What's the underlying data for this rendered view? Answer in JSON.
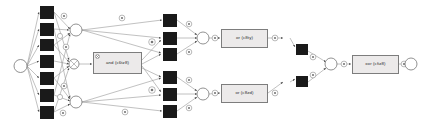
{
  "diagram": {
    "type": "process-model-graph",
    "title": "",
    "background_color": "#ffffff",
    "colors": {
      "transition_fill": "#1a1a1a",
      "place_fill": "#ffffff",
      "place_stroke": "#6e6e6e",
      "edge_stroke": "#9a9a9a",
      "box_fill": "#eceaea",
      "box_stroke": "#7d7d7d",
      "marker_stroke": "#8a8a8a",
      "text_color": "#2b2b2b"
    },
    "labels": {
      "and_box": "and (c6tz8)",
      "or_box_top": "or (c8ty)",
      "or_box_bottom": "or (c8zd)",
      "xor_box": "xor (cfiz8)"
    },
    "counts": {
      "source_places": 1,
      "sink_places": 1,
      "transitions_column1": 7,
      "transitions_column2": 6,
      "transitions_column3": 2,
      "join_places": 4,
      "labeled_boxes": 4
    },
    "nodes": {
      "source": {
        "name": "source-place",
        "cx": 20.5,
        "cy": 66,
        "r": 6.5
      },
      "sink": {
        "name": "sink-place",
        "cx": 411,
        "cy": 64,
        "r": 6
      },
      "col1": [
        {
          "x": 40,
          "y": 6,
          "w": 14,
          "h": 13
        },
        {
          "x": 40,
          "y": 23,
          "w": 14,
          "h": 13
        },
        {
          "x": 40,
          "y": 39,
          "w": 14,
          "h": 12
        },
        {
          "x": 40,
          "y": 55,
          "w": 14,
          "h": 13
        },
        {
          "x": 40,
          "y": 72,
          "w": 14,
          "h": 13
        },
        {
          "x": 40,
          "y": 89,
          "w": 14,
          "h": 13
        },
        {
          "x": 40,
          "y": 106,
          "w": 14,
          "h": 13
        }
      ],
      "col1_places": [
        {
          "cx": 76,
          "cy": 30,
          "r": 6
        },
        {
          "cx": 76,
          "cy": 102,
          "r": 6
        }
      ],
      "and_gate_place": {
        "cx": 74,
        "cy": 64,
        "r": 5
      },
      "col2": [
        {
          "x": 163,
          "y": 14,
          "w": 14,
          "h": 13
        },
        {
          "x": 163,
          "y": 32,
          "w": 14,
          "h": 13
        },
        {
          "x": 163,
          "y": 48,
          "w": 14,
          "h": 13
        },
        {
          "x": 163,
          "y": 71,
          "w": 14,
          "h": 13
        },
        {
          "x": 163,
          "y": 88,
          "w": 14,
          "h": 13
        },
        {
          "x": 163,
          "y": 105,
          "w": 14,
          "h": 13
        }
      ],
      "col2_places": [
        {
          "cx": 203,
          "cy": 38,
          "r": 6
        },
        {
          "cx": 203,
          "cy": 94,
          "r": 6
        }
      ],
      "col3": [
        {
          "x": 296,
          "y": 44,
          "w": 12,
          "h": 11
        },
        {
          "x": 296,
          "y": 76,
          "w": 12,
          "h": 11
        }
      ],
      "merge_place": {
        "cx": 331,
        "cy": 64,
        "r": 6
      },
      "mid_places": [
        {
          "cx": 286,
          "cy": 38,
          "r": 5
        },
        {
          "cx": 286,
          "cy": 82,
          "r": 5
        }
      ]
    },
    "boxes": [
      {
        "name": "and-box",
        "x": 93,
        "y": 52,
        "w": 49,
        "h": 22,
        "label_key": "and_box"
      },
      {
        "name": "or-box-top",
        "x": 221,
        "y": 29,
        "w": 47,
        "h": 19,
        "label_key": "or_box_top"
      },
      {
        "name": "or-box-bottom",
        "x": 221,
        "y": 84,
        "w": 47,
        "h": 19,
        "label_key": "or_box_bottom"
      },
      {
        "name": "xor-box",
        "x": 352,
        "y": 55,
        "w": 47,
        "h": 19,
        "label_key": "xor_box"
      }
    ]
  }
}
